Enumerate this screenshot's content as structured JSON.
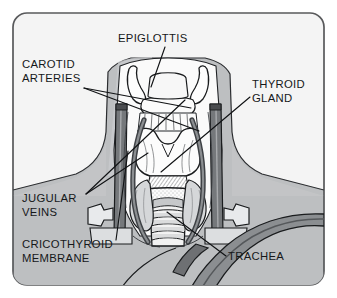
{
  "figure": {
    "type": "anatomical-illustration",
    "frame": {
      "border_color": "#58595b",
      "background_color": "#f4f4f4",
      "corner_radius": 14
    },
    "palette": {
      "outline": "#1a1c1e",
      "page_background": "#ffffff",
      "panel_background": "#f4f4f4",
      "skin_shading": "#b9bbbd",
      "skin_shading_light": "#cbcdcf",
      "cartilage_fill": "#fbfbfb",
      "vessel_dark": "#6e7073",
      "vessel_darker": "#4a4c4f",
      "label_color": "#16181a"
    }
  },
  "labels": [
    {
      "id": "epiglottis",
      "name": "epiglottis",
      "lines": [
        "EPIGLOTTIS"
      ],
      "x": 118,
      "y": 42,
      "anchor": "start",
      "leaders": [
        {
          "x1": 165,
          "y1": 47,
          "x2": 151,
          "y2": 87
        }
      ]
    },
    {
      "id": "carotid-arteries",
      "name": "carotid-arteries",
      "lines": [
        "CAROTID",
        "ARTERIES"
      ],
      "x": 22,
      "y": 68,
      "anchor": "start",
      "leaders": [
        {
          "x1": 84,
          "y1": 88,
          "x2": 199,
          "y2": 131
        },
        {
          "x1": 84,
          "y1": 88,
          "x2": 191,
          "y2": 108
        }
      ]
    },
    {
      "id": "thyroid-gland",
      "name": "thyroid-gland",
      "lines": [
        "THYROID",
        "GLAND"
      ],
      "x": 252,
      "y": 88,
      "anchor": "start",
      "leaders": [
        {
          "x1": 250,
          "y1": 97,
          "x2": 161,
          "y2": 172
        }
      ]
    },
    {
      "id": "jugular-veins",
      "name": "jugular-veins",
      "lines": [
        "JUGULAR",
        "VEINS"
      ],
      "x": 22,
      "y": 202,
      "anchor": "start",
      "leaders": [
        {
          "x1": 86,
          "y1": 194,
          "x2": 185,
          "y2": 100
        },
        {
          "x1": 86,
          "y1": 194,
          "x2": 148,
          "y2": 153
        }
      ]
    },
    {
      "id": "cricothyroid-membrane",
      "name": "cricothyroid-membrane",
      "lines": [
        "CRICOTHYROID",
        "MEMBRANE"
      ],
      "x": 22,
      "y": 248,
      "anchor": "start",
      "leaders": [
        {
          "x1": 116,
          "y1": 240,
          "x2": 128,
          "y2": 151
        }
      ]
    },
    {
      "id": "trachea",
      "name": "trachea",
      "lines": [
        "TRACHEA"
      ],
      "x": 228,
      "y": 260,
      "anchor": "start",
      "leaders": [
        {
          "x1": 226,
          "y1": 256,
          "x2": 167,
          "y2": 212
        }
      ]
    }
  ],
  "structures": [
    {
      "id": "neck-silhouette",
      "name": "neck-and-shoulders"
    },
    {
      "id": "hyoid-bone",
      "name": "hyoid-bone"
    },
    {
      "id": "epiglottis-tab",
      "name": "epiglottis-cartilage"
    },
    {
      "id": "thyroid-cartilage",
      "name": "thyroid-cartilage"
    },
    {
      "id": "cricothyroid-membrane-area",
      "name": "cricothyroid-membrane"
    },
    {
      "id": "cricoid-cartilage",
      "name": "cricoid-cartilage"
    },
    {
      "id": "trachea-rings",
      "name": "tracheal-rings"
    },
    {
      "id": "thyroid-gland-lobes",
      "name": "thyroid-gland-lobes"
    },
    {
      "id": "carotid-left",
      "name": "left-carotid-artery"
    },
    {
      "id": "carotid-right",
      "name": "right-carotid-artery"
    },
    {
      "id": "jugular-left",
      "name": "left-jugular-vein"
    },
    {
      "id": "jugular-right",
      "name": "right-jugular-vein"
    },
    {
      "id": "clavicle-left",
      "name": "left-clavicle"
    },
    {
      "id": "clavicle-right",
      "name": "right-clavicle"
    },
    {
      "id": "great-vessel-arch",
      "name": "brachiocephalic-vessel-arch"
    }
  ]
}
